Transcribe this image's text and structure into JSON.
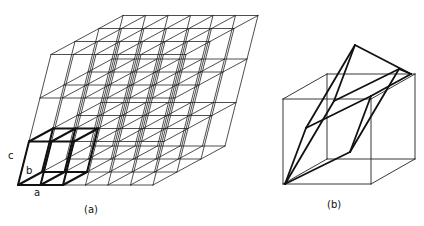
{
  "figure": {
    "panel_a": {
      "caption": "(a)",
      "vector_labels": {
        "a": "a",
        "b": "b",
        "c": "c"
      },
      "grid": {
        "cells_a": 6,
        "cells_b": 3,
        "cells_c": 3
      },
      "highlighted_cell": {
        "span_a": 2,
        "span_b": 1,
        "span_c": 1
      }
    },
    "panel_b": {
      "caption": "(b)",
      "description": "cube containing rhombohedral cell along body diagonal"
    },
    "colors": {
      "line": "#222222",
      "bold_line": "#111111",
      "background": "#ffffff"
    }
  }
}
